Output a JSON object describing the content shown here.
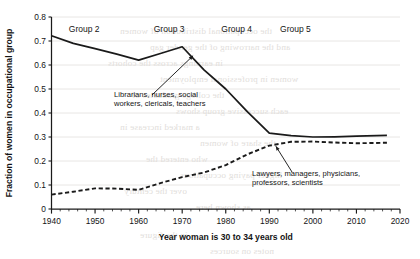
{
  "chart_data": {
    "type": "line",
    "title": "",
    "xlabel": "Year woman is 30 to 34 years old",
    "ylabel": "Fraction of women in occupational group",
    "xlim": [
      1940,
      2020
    ],
    "ylim": [
      0,
      0.8
    ],
    "xticks": [
      1940,
      1950,
      1960,
      1970,
      1980,
      1990,
      2000,
      2010,
      2020
    ],
    "xtick_labels": [
      "1940",
      "1950",
      "1960",
      "1970",
      "1980",
      "1990",
      "2000",
      "2010",
      "2020"
    ],
    "yticks": [
      0,
      0.1,
      0.2,
      0.3,
      0.4,
      0.5,
      0.6,
      0.7,
      0.8
    ],
    "ytick_labels": [
      "0",
      "0.1",
      "0.2",
      "0.3",
      "0.4",
      "0.5",
      "0.6",
      "0.7",
      "0.8"
    ],
    "x_minor_tick_step": 2,
    "grid": "horizontal-faint",
    "legend": "none",
    "series": [
      {
        "name": "Librarians, nurses, social workers, clericals, teachers",
        "style": "solid",
        "color": "#1a1a1a",
        "points": [
          [
            1940,
            0.722
          ],
          [
            1945,
            0.69
          ],
          [
            1950,
            0.668
          ],
          [
            1955,
            0.645
          ],
          [
            1960,
            0.62
          ],
          [
            1965,
            0.648
          ],
          [
            1970,
            0.676
          ],
          [
            1975,
            0.58
          ],
          [
            1980,
            0.5
          ],
          [
            1985,
            0.405
          ],
          [
            1990,
            0.316
          ],
          [
            1995,
            0.306
          ],
          [
            2000,
            0.3
          ],
          [
            2005,
            0.301
          ],
          [
            2010,
            0.304
          ],
          [
            2017,
            0.307
          ]
        ]
      },
      {
        "name": "Lawyers, managers, physicians, professors, scientists",
        "style": "dashed",
        "color": "#1a1a1a",
        "points": [
          [
            1940,
            0.06
          ],
          [
            1945,
            0.072
          ],
          [
            1950,
            0.086
          ],
          [
            1955,
            0.085
          ],
          [
            1960,
            0.08
          ],
          [
            1965,
            0.108
          ],
          [
            1970,
            0.133
          ],
          [
            1975,
            0.152
          ],
          [
            1980,
            0.183
          ],
          [
            1985,
            0.228
          ],
          [
            1990,
            0.264
          ],
          [
            1995,
            0.28
          ],
          [
            2000,
            0.281
          ],
          [
            2005,
            0.277
          ],
          [
            2010,
            0.274
          ],
          [
            2017,
            0.276
          ]
        ]
      }
    ],
    "group_labels": [
      {
        "text": "Group 2",
        "x": 1947.5
      },
      {
        "text": "Group 3",
        "x": 1967.0
      },
      {
        "text": "Group 4",
        "x": 1982.5
      },
      {
        "text": "Group 5",
        "x": 1996.0
      }
    ],
    "annotations": [
      {
        "id": "upper-annotation",
        "lines": [
          "Librarians, nurses, social",
          "workers, clericals, teachers"
        ],
        "target": [
          1972.5,
          0.645
        ]
      },
      {
        "id": "lower-annotation",
        "lines": [
          "Lawyers, managers, physicians,",
          "professors, scientists"
        ],
        "target": [
          1991.5,
          0.268
        ]
      }
    ]
  },
  "bleed_through": {
    "description": "faint mirrored text showing through from the reverse side of the printed page",
    "lines": [
      {
        "text": "the occupational distribution of women",
        "x": 120,
        "y": 26
      },
      {
        "text": "and the narrowing of the gender gap",
        "x": 150,
        "y": 42
      },
      {
        "text": "in earnings across the cohorts",
        "x": 108,
        "y": 58
      },
      {
        "text": "women in professional employment",
        "x": 160,
        "y": 74
      },
      {
        "text": "the college graduates of",
        "x": 132,
        "y": 90
      },
      {
        "text": "each successive group shows",
        "x": 176,
        "y": 106
      },
      {
        "text": "a marked increase in",
        "x": 120,
        "y": 122
      },
      {
        "text": "the share of women",
        "x": 200,
        "y": 138
      },
      {
        "text": "who entered the",
        "x": 146,
        "y": 154
      },
      {
        "text": "higher paying occupations",
        "x": 180,
        "y": 170
      },
      {
        "text": "over the century",
        "x": 124,
        "y": 186
      },
      {
        "text": "as shown here",
        "x": 196,
        "y": 202
      },
      {
        "text": "in the figure",
        "x": 140,
        "y": 230
      },
      {
        "text": "notes on sources",
        "x": 210,
        "y": 246
      }
    ]
  }
}
